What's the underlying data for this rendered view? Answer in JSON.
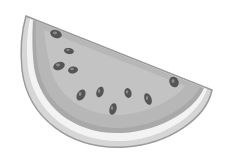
{
  "image": {
    "subject": "watermelon-slice",
    "style": "grayscale illustration",
    "background": "#ffffff"
  },
  "colors": {
    "outline": "#9a9a9a",
    "outer_rind": "#d6d6d6",
    "inner_rind": "#f3f3f3",
    "flesh_border": "#a9a9a9",
    "flesh": "#b7b7b7",
    "flesh_highlight": "#c6c6c6",
    "seed": "#555555",
    "seed_highlight": "#8a8a8a"
  },
  "seeds": [
    {
      "x": 56,
      "y": 34,
      "rx": 6,
      "ry": 4,
      "rot": 20
    },
    {
      "x": 69,
      "y": 51,
      "rx": 5,
      "ry": 3,
      "rot": 10
    },
    {
      "x": 59,
      "y": 66,
      "rx": 6,
      "ry": 4,
      "rot": -20
    },
    {
      "x": 73,
      "y": 70,
      "rx": 5,
      "ry": 3.5,
      "rot": -10
    },
    {
      "x": 81,
      "y": 95,
      "rx": 4,
      "ry": 6,
      "rot": 30
    },
    {
      "x": 100,
      "y": 92,
      "rx": 3.5,
      "ry": 5.5,
      "rot": 20
    },
    {
      "x": 128,
      "y": 93,
      "rx": 3.5,
      "ry": 5,
      "rot": -15
    },
    {
      "x": 148,
      "y": 99,
      "rx": 3.5,
      "ry": 6,
      "rot": -20
    },
    {
      "x": 113,
      "y": 109,
      "rx": 3.5,
      "ry": 6,
      "rot": 15
    },
    {
      "x": 174,
      "y": 82,
      "rx": 4.5,
      "ry": 5.5,
      "rot": -30
    }
  ]
}
